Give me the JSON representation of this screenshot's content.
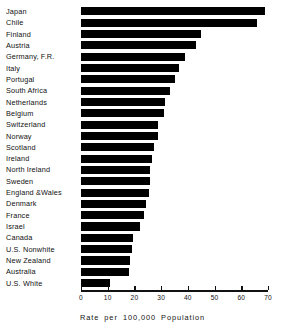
{
  "chart_data": {
    "type": "bar",
    "orientation": "horizontal",
    "title": "",
    "xlabel": "Rate  per  100,000  Population",
    "ylabel": "",
    "xlim": [
      0,
      70
    ],
    "xticks": [
      0,
      10,
      20,
      30,
      40,
      50,
      60,
      70
    ],
    "xtick_labels": [
      "0",
      "10",
      "20",
      "30",
      "40",
      "50",
      "60",
      "70"
    ],
    "grid": false,
    "legend": null,
    "bar_color": "#000000",
    "axis_color": "#111111",
    "categories": [
      "Japan",
      "Chile",
      "Finland",
      "Austria",
      "Germany, F.R.",
      "Italy",
      "Portugal",
      "South  Africa",
      "Netherlands",
      "Belgium",
      "Switzerland",
      "Norway",
      "Scotland",
      "Ireland",
      "North  Ireland",
      "Sweden",
      "England &Wales",
      "Denmark",
      "France",
      "Israel",
      "Canada",
      "U.S.  Nonwhite",
      "New  Zealand",
      "Australia",
      "U.S.  White"
    ],
    "values": [
      69.0,
      66.0,
      45.0,
      43.0,
      39.0,
      36.5,
      35.0,
      33.5,
      31.5,
      31.0,
      29.0,
      29.0,
      27.5,
      26.5,
      26.0,
      26.0,
      25.5,
      24.5,
      23.5,
      22.0,
      19.5,
      19.0,
      18.5,
      18.0,
      11.0
    ]
  }
}
